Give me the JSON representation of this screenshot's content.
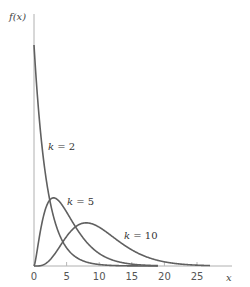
{
  "chart_data": {
    "type": "line",
    "title": "",
    "xlabel": "x",
    "ylabel": "f(x)",
    "xlim": [
      0,
      28
    ],
    "ylim": [
      0,
      0.55
    ],
    "xticks": [
      0,
      5,
      10,
      15,
      20,
      25
    ],
    "xtick_labels": [
      "0",
      "5",
      "10",
      "15",
      "20",
      "25"
    ],
    "grid": false,
    "series": [
      {
        "name": "k = 2",
        "k": 2,
        "x_range": [
          0,
          19
        ],
        "annotation": "k = 2"
      },
      {
        "name": "k = 5",
        "k": 5,
        "x_range": [
          0,
          19
        ],
        "annotation": "k = 5"
      },
      {
        "name": "k = 10",
        "k": 10,
        "x_range": [
          0,
          27
        ],
        "annotation": "k = 10"
      }
    ],
    "distribution": "chi-square"
  }
}
